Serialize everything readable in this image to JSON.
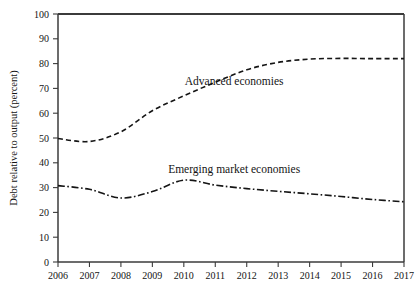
{
  "figure": {
    "background_color": "#ffffff",
    "frame_color": "#3b3b3b",
    "line_color": "#151515"
  },
  "chart_data": {
    "type": "line",
    "title": "",
    "subtitle": "",
    "xlabel": "",
    "ylabel": "Debt relative to output (percent)",
    "x": [
      2006,
      2007,
      2008,
      2009,
      2010,
      2011,
      2012,
      2013,
      2014,
      2015,
      2016,
      2017
    ],
    "categories": [
      "2006",
      "2007",
      "2008",
      "2009",
      "2010",
      "2011",
      "2012",
      "2013",
      "2014",
      "2015",
      "2016",
      "2017"
    ],
    "series": [
      {
        "name": "Advanced economies",
        "label": "Advanced economies",
        "dash": "dashed",
        "values": [
          49.8,
          48.6,
          52.5,
          61.0,
          67.0,
          72.5,
          77.5,
          80.5,
          81.8,
          82.1,
          82.0,
          82.0
        ]
      },
      {
        "name": "Emerging market economies",
        "label": "Emerging market economies",
        "dash": "dash-dot",
        "values": [
          30.8,
          29.3,
          25.8,
          28.4,
          33.0,
          31.0,
          29.6,
          28.5,
          27.5,
          26.4,
          25.2,
          24.3
        ]
      }
    ],
    "ylim": [
      0,
      100
    ],
    "xlim": [
      2006,
      2017
    ],
    "yticks": [
      0,
      10,
      20,
      30,
      40,
      50,
      60,
      70,
      80,
      90,
      100
    ],
    "ytick_labels": [
      "0",
      "10",
      "20",
      "30",
      "40",
      "50",
      "60",
      "70",
      "80",
      "90",
      "100"
    ],
    "xtick_labels": [
      "2006",
      "2007",
      "2008",
      "2009",
      "2010",
      "2011",
      "2012",
      "2013",
      "2014",
      "2015",
      "2016",
      "2017"
    ],
    "grid": false,
    "legend": "inline-annotations",
    "annotations": [
      {
        "text": "Advanced economies",
        "x": 2011.6,
        "y": 71.5
      },
      {
        "text": "Emerging market economies",
        "x": 2011.6,
        "y": 36.0
      }
    ]
  }
}
